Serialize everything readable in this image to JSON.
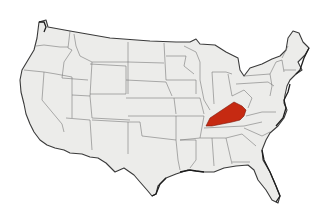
{
  "map": {
    "subject": "United States (contiguous 48 states)",
    "highlighted_state": "Kentucky",
    "highlight_color": "#c62a12",
    "land_color": "#ececea",
    "border_color": "#6e6e6e",
    "coast_color": "#1e1e1e",
    "background_color": "#ffffff"
  }
}
